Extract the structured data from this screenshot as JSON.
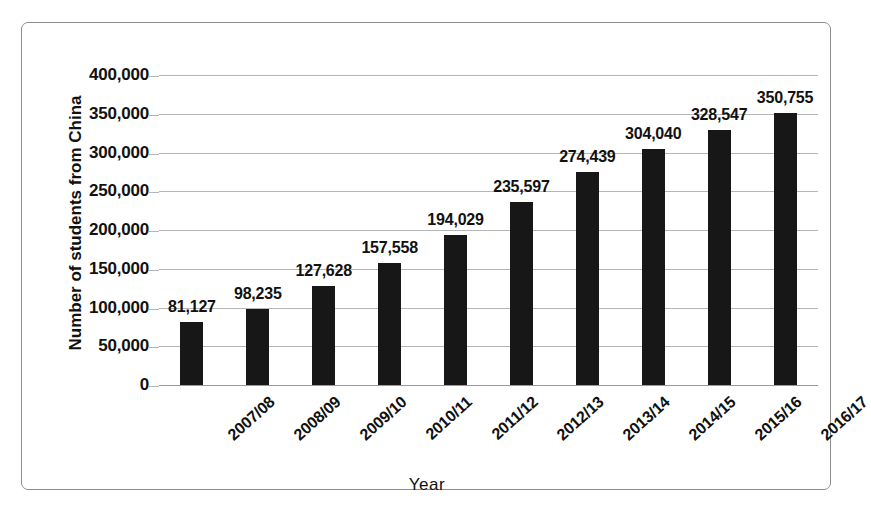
{
  "chart_data": {
    "type": "bar",
    "title": "",
    "xlabel": "Year",
    "ylabel": "Number of students from China",
    "categories": [
      "2007/08",
      "2008/09",
      "2009/10",
      "2010/11",
      "2011/12",
      "2012/13",
      "2013/14",
      "2014/15",
      "2015/16",
      "2016/17"
    ],
    "values": [
      81127,
      98235,
      127628,
      157558,
      194029,
      235597,
      274439,
      304040,
      328547,
      350755
    ],
    "value_labels": [
      "81,127",
      "98,235",
      "127,628",
      "157,558",
      "194,029",
      "235,597",
      "274,439",
      "304,040",
      "328,547",
      "350,755"
    ],
    "ylim": [
      0,
      400000
    ],
    "ytick_values": [
      0,
      50000,
      100000,
      150000,
      200000,
      250000,
      300000,
      350000,
      400000
    ],
    "ytick_labels": [
      "0",
      "50,000",
      "100,000",
      "150,000",
      "200,000",
      "250,000",
      "300,000",
      "350,000",
      "400,000"
    ],
    "grid": true,
    "legend": false,
    "legend_position": "none",
    "bar_color": "#171717",
    "gridline_color": "#b6b6b6",
    "frame_color": "#8d8d8d",
    "background_color": "#ffffff",
    "xtick_rotation_degrees": -42
  }
}
